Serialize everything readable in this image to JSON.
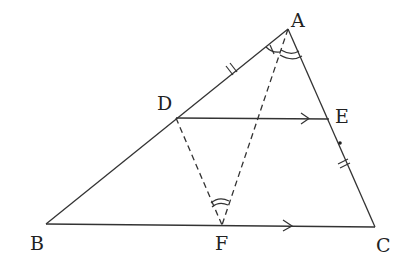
{
  "diagram": {
    "type": "geometry-triangle",
    "points": {
      "A": {
        "label": "A",
        "x": 288,
        "y": 29
      },
      "B": {
        "label": "B",
        "x": 46,
        "y": 224
      },
      "C": {
        "label": "C",
        "x": 375,
        "y": 227
      },
      "D": {
        "label": "D",
        "x": 176,
        "y": 118
      },
      "E": {
        "label": "E",
        "x": 329,
        "y": 119
      },
      "F": {
        "label": "F",
        "x": 222,
        "y": 225
      }
    },
    "segments": [
      {
        "from": "A",
        "to": "B",
        "style": "solid"
      },
      {
        "from": "A",
        "to": "C",
        "style": "solid"
      },
      {
        "from": "B",
        "to": "C",
        "style": "solid",
        "arrow": "parallel"
      },
      {
        "from": "D",
        "to": "E",
        "style": "solid",
        "arrow": "parallel"
      },
      {
        "from": "A",
        "to": "F",
        "style": "dashed"
      },
      {
        "from": "D",
        "to": "F",
        "style": "dashed"
      }
    ],
    "markings": [
      {
        "type": "equal-tick-double",
        "segment": "AD"
      },
      {
        "type": "equal-tick-double",
        "segment": "EC"
      },
      {
        "type": "angle-single-tick",
        "vertex": "A",
        "between": "AB-AF"
      },
      {
        "type": "angle-double-arc",
        "vertex": "A",
        "between": "AF-AC"
      },
      {
        "type": "angle-double-arc",
        "vertex": "F",
        "between": "FD-FA"
      },
      {
        "type": "dot",
        "on": "EC"
      }
    ]
  }
}
